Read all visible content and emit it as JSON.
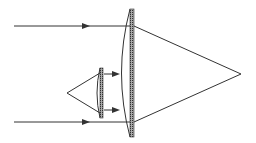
{
  "diagram": {
    "type": "optics-ray-diagram",
    "colors": {
      "line": "#333333",
      "hatch": "#555555",
      "background": "#ffffff"
    },
    "elements": {
      "incoming_rays": [
        {
          "label": "top-ray",
          "y": 26
        },
        {
          "label": "bottom-ray",
          "y": 122
        }
      ],
      "large_lens": {
        "x": 130,
        "y_top": 9,
        "y_bottom": 137
      },
      "small_lens": {
        "x": 101,
        "y_top": 68,
        "y_bottom": 118
      },
      "point_source": {
        "x": 67,
        "y": 93
      },
      "focal_point": {
        "x": 241,
        "y": 74
      }
    }
  }
}
